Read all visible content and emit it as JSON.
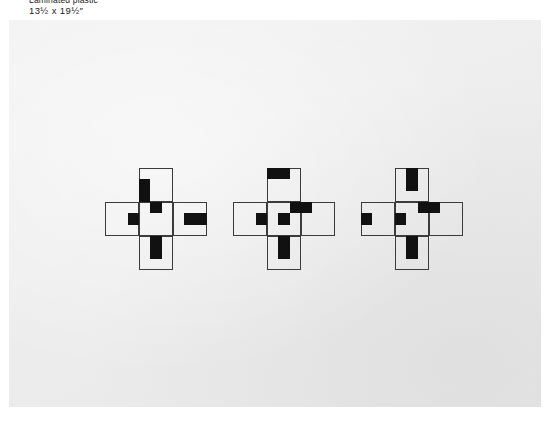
{
  "caption": {
    "material": "Laminated plastic",
    "dimensions": "13½ x 19½″"
  },
  "artwork": {
    "background_color": "#eeeeee",
    "line_color": "#3b3b3b",
    "fill_color": "#111111",
    "figure_count": 3,
    "module_note": "each figure is a plus-shaped arrangement of 5 large squares, each square subdivided into a 3x3 grid of small cells"
  },
  "figures": [
    {
      "name": "figure-1",
      "x": 105,
      "y": 168,
      "squares": [
        {
          "name": "top",
          "col": 1,
          "row": 0
        },
        {
          "name": "left",
          "col": 0,
          "row": 1
        },
        {
          "name": "center",
          "col": 1,
          "row": 1
        },
        {
          "name": "right",
          "col": 2,
          "row": 1
        },
        {
          "name": "bottom",
          "col": 1,
          "row": 2
        }
      ],
      "black_cells": [
        {
          "square": "top",
          "col": 0,
          "row": 1
        },
        {
          "square": "top",
          "col": 0,
          "row": 2
        },
        {
          "square": "center",
          "col": 1,
          "row": 0
        },
        {
          "square": "left",
          "col": 2,
          "row": 1
        },
        {
          "square": "right",
          "col": 1,
          "row": 1
        },
        {
          "square": "right",
          "col": 2,
          "row": 1
        },
        {
          "square": "bottom",
          "col": 1,
          "row": 0
        },
        {
          "square": "bottom",
          "col": 1,
          "row": 1
        }
      ]
    },
    {
      "name": "figure-2",
      "x": 233,
      "y": 168,
      "squares": [
        {
          "name": "top",
          "col": 1,
          "row": 0
        },
        {
          "name": "left",
          "col": 0,
          "row": 1
        },
        {
          "name": "center",
          "col": 1,
          "row": 1
        },
        {
          "name": "right",
          "col": 2,
          "row": 1
        },
        {
          "name": "bottom",
          "col": 1,
          "row": 2
        }
      ],
      "black_cells": [
        {
          "square": "top",
          "col": 0,
          "row": 0
        },
        {
          "square": "top",
          "col": 1,
          "row": 0
        },
        {
          "square": "center",
          "col": 2,
          "row": 0
        },
        {
          "square": "right",
          "col": 0,
          "row": 0
        },
        {
          "square": "left",
          "col": 2,
          "row": 1
        },
        {
          "square": "center",
          "col": 1,
          "row": 1
        },
        {
          "square": "bottom",
          "col": 1,
          "row": 0
        },
        {
          "square": "bottom",
          "col": 1,
          "row": 1
        }
      ]
    },
    {
      "name": "figure-3",
      "x": 361,
      "y": 168,
      "squares": [
        {
          "name": "top",
          "col": 1,
          "row": 0
        },
        {
          "name": "left",
          "col": 0,
          "row": 1
        },
        {
          "name": "center",
          "col": 1,
          "row": 1
        },
        {
          "name": "right",
          "col": 2,
          "row": 1
        },
        {
          "name": "bottom",
          "col": 1,
          "row": 2
        }
      ],
      "black_cells": [
        {
          "square": "top",
          "col": 1,
          "row": 0
        },
        {
          "square": "top",
          "col": 1,
          "row": 1
        },
        {
          "square": "center",
          "col": 2,
          "row": 0
        },
        {
          "square": "right",
          "col": 0,
          "row": 0
        },
        {
          "square": "left",
          "col": 0,
          "row": 1
        },
        {
          "square": "center",
          "col": 0,
          "row": 1
        },
        {
          "square": "bottom",
          "col": 1,
          "row": 0
        },
        {
          "square": "bottom",
          "col": 1,
          "row": 1
        }
      ]
    }
  ]
}
